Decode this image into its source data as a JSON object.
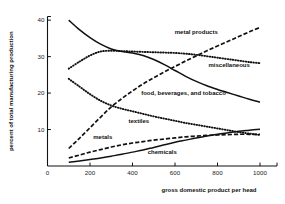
{
  "chart_data": {
    "type": "line",
    "title": "",
    "xlabel": "gross domestic product per head",
    "ylabel": "percent of total manufacturing production",
    "xlim": [
      0,
      1080
    ],
    "ylim": [
      0,
      41
    ],
    "xticks": [
      0,
      200,
      400,
      600,
      800,
      1000
    ],
    "yticks": [
      10,
      20,
      30,
      40
    ],
    "grid": false,
    "legend": "inline-annotations",
    "series": [
      {
        "name": "food, beverages, and tobacco",
        "style": "solid",
        "label": "food, beverages, and tobacco",
        "x": [
          100,
          150,
          200,
          250,
          300,
          350,
          400,
          450,
          500,
          550,
          600,
          650,
          700,
          750,
          800,
          850,
          900,
          950,
          1000
        ],
        "values": [
          40.0,
          37.4,
          35.2,
          33.4,
          32.1,
          31.4,
          31.0,
          30.3,
          29.2,
          27.8,
          26.2,
          24.6,
          23.2,
          22.0,
          21.0,
          20.1,
          19.2,
          18.3,
          17.5
        ]
      },
      {
        "name": "miscellaneous",
        "style": "dotted",
        "label": "miscellaneous",
        "x": [
          100,
          150,
          200,
          250,
          300,
          350,
          400,
          450,
          500,
          550,
          600,
          650,
          700,
          750,
          800,
          850,
          900,
          950,
          1000
        ],
        "values": [
          26.7,
          28.6,
          30.3,
          31.4,
          31.6,
          31.5,
          31.4,
          31.3,
          31.2,
          31.1,
          31.0,
          30.8,
          30.5,
          30.1,
          29.7,
          29.3,
          28.9,
          28.5,
          28.2
        ]
      },
      {
        "name": "metal products",
        "style": "dashed",
        "label": "metal products",
        "x": [
          100,
          150,
          200,
          250,
          300,
          350,
          400,
          450,
          500,
          550,
          600,
          650,
          700,
          750,
          800,
          850,
          900,
          950,
          1000
        ],
        "values": [
          4.8,
          7.6,
          10.5,
          13.4,
          16.2,
          18.5,
          20.6,
          22.5,
          24.2,
          25.8,
          27.3,
          28.8,
          30.2,
          31.6,
          32.9,
          34.2,
          35.5,
          36.8,
          38.0
        ]
      },
      {
        "name": "textiles",
        "style": "dotted",
        "label": "textiles",
        "x": [
          100,
          150,
          200,
          250,
          300,
          350,
          400,
          450,
          500,
          550,
          600,
          650,
          700,
          750,
          800,
          850,
          900,
          950,
          1000
        ],
        "values": [
          23.9,
          21.8,
          19.7,
          17.9,
          16.6,
          15.7,
          15.0,
          14.3,
          13.6,
          13.0,
          12.4,
          11.8,
          11.3,
          10.8,
          10.3,
          9.8,
          9.3,
          8.9,
          8.5
        ]
      },
      {
        "name": "metals",
        "style": "dashed",
        "label": "metals",
        "x": [
          100,
          150,
          200,
          250,
          300,
          350,
          400,
          450,
          500,
          550,
          600,
          650,
          700,
          750,
          800,
          850,
          900,
          950,
          1000
        ],
        "values": [
          2.2,
          3.0,
          3.8,
          4.5,
          5.2,
          5.8,
          6.3,
          6.7,
          7.1,
          7.4,
          7.7,
          8.0,
          8.2,
          8.4,
          8.5,
          8.6,
          8.7,
          8.7,
          8.7
        ]
      },
      {
        "name": "chemicals",
        "style": "solid",
        "label": "chemicals",
        "x": [
          100,
          150,
          200,
          250,
          300,
          350,
          400,
          450,
          500,
          550,
          600,
          650,
          700,
          750,
          800,
          850,
          900,
          950,
          1000
        ],
        "values": [
          1.0,
          1.4,
          1.8,
          2.2,
          2.7,
          3.2,
          3.8,
          4.4,
          5.1,
          5.8,
          6.5,
          7.1,
          7.7,
          8.2,
          8.7,
          9.1,
          9.5,
          9.8,
          10.1
        ]
      }
    ],
    "annotations": [
      {
        "text": "metal products",
        "x": 700,
        "y": 36.2
      },
      {
        "text": "miscellaneous",
        "x": 855,
        "y": 27.2
      },
      {
        "text": "food, beverages, and tobacco",
        "x": 640,
        "y": 19.6
      },
      {
        "text": "textiles",
        "x": 430,
        "y": 11.8
      },
      {
        "text": "metals",
        "x": 260,
        "y": 7.3
      },
      {
        "text": "chemicals",
        "x": 540,
        "y": 3.3
      }
    ]
  }
}
